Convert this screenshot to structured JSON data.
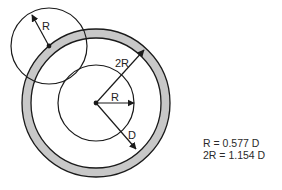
{
  "diagram": {
    "labels": {
      "small_radius": "R",
      "outer_radius": "2R",
      "inner_radius": "R",
      "diameter_ref": "D"
    },
    "formulas": [
      "R = 0.577 D",
      "2R = 1.154 D"
    ],
    "colors": {
      "ring_fill": "#c8c8c8",
      "stroke": "#1a1a1a",
      "background": "#ffffff"
    },
    "geometry": {
      "main_center": [
        96,
        103
      ],
      "outer_ring_radius": 74,
      "inner_ring_radius": 65,
      "inner_circle_radius": 38,
      "small_circle_center": [
        49,
        46
      ],
      "small_circle_radius": 38
    }
  }
}
